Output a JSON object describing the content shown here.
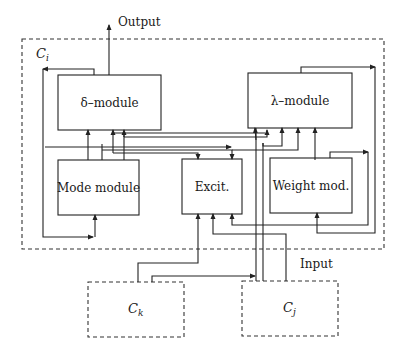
{
  "diagram": {
    "output_label": "Output",
    "input_label": "Input",
    "containers": {
      "ci": {
        "label": "C",
        "sub": "i"
      },
      "ck": {
        "label": "C",
        "sub": "k"
      },
      "cj": {
        "label": "C",
        "sub": "j"
      }
    },
    "modules": {
      "delta": {
        "label": "δ–module"
      },
      "lambda": {
        "label": "λ–module"
      },
      "mode": {
        "label": "Mode module"
      },
      "excit": {
        "label": "Excit."
      },
      "weight": {
        "label": "Weight mod."
      }
    }
  }
}
